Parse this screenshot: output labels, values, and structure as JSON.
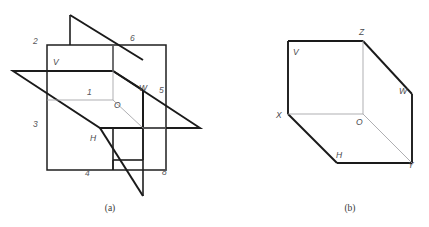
{
  "figure": {
    "colors": {
      "stroke_thick": "#1a1a1a",
      "stroke_thin": "#2b2b2b",
      "stroke_hairline": "#9a9a9a",
      "label": "#56565a",
      "caption": "#3a3a3a",
      "background": "#ffffff"
    },
    "panels": [
      {
        "id": "panel-a",
        "caption": "(a)",
        "caption_pos": {
          "x": 110,
          "y": 211
        },
        "description": "Three mutually perpendicular projection planes divided into eight octants",
        "labels": [
          {
            "name": "label-quadrant-2",
            "text": "2",
            "x": 33,
            "y": 44
          },
          {
            "name": "label-plane-v",
            "text": "V",
            "x": 53,
            "y": 65
          },
          {
            "name": "label-quadrant-6",
            "text": "6",
            "x": 130,
            "y": 41
          },
          {
            "name": "label-quadrant-1",
            "text": "1",
            "x": 87,
            "y": 95
          },
          {
            "name": "label-origin-o",
            "text": "O",
            "x": 114,
            "y": 108
          },
          {
            "name": "label-plane-w",
            "text": "W",
            "x": 139,
            "y": 91
          },
          {
            "name": "label-quadrant-5",
            "text": "5",
            "x": 159,
            "y": 93
          },
          {
            "name": "label-quadrant-3",
            "text": "3",
            "x": 33,
            "y": 127
          },
          {
            "name": "label-plane-h",
            "text": "H",
            "x": 90,
            "y": 141
          },
          {
            "name": "label-quadrant-4",
            "text": "4",
            "x": 85,
            "y": 176
          },
          {
            "name": "label-quadrant-8",
            "text": "8",
            "x": 162,
            "y": 175
          }
        ]
      },
      {
        "id": "panel-b",
        "caption": "(b)",
        "caption_pos": {
          "x": 350,
          "y": 211
        },
        "description": "First-octant trihedral corner formed by planes V, H and W",
        "labels": [
          {
            "name": "label-vertex-z",
            "text": "Z",
            "x": 359,
            "y": 35
          },
          {
            "name": "label-plane-v-b",
            "text": "V",
            "x": 293,
            "y": 55
          },
          {
            "name": "label-plane-w-b",
            "text": "W",
            "x": 399,
            "y": 94
          },
          {
            "name": "label-vertex-x",
            "text": "X",
            "x": 276,
            "y": 118
          },
          {
            "name": "label-origin-o-b",
            "text": "O",
            "x": 356,
            "y": 125
          },
          {
            "name": "label-plane-h-b",
            "text": "H",
            "x": 336,
            "y": 158
          },
          {
            "name": "label-vertex-y",
            "text": "Y",
            "x": 408,
            "y": 168
          }
        ]
      }
    ]
  }
}
